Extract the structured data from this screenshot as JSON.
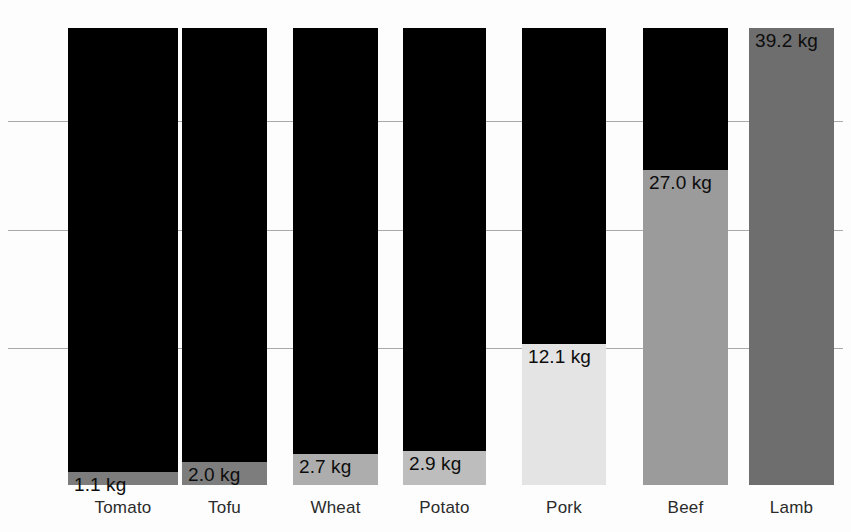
{
  "chart": {
    "type": "stacked-bar",
    "title": "",
    "units": "kg",
    "background_color": "#fdfdfd",
    "remainder_color": "#000000",
    "gridline_color": "#9a9a9a"
  },
  "chart_data": {
    "type": "bar",
    "title": "",
    "subtitle": "",
    "xlabel": "",
    "ylabel": "",
    "categories": [
      "Tomato",
      "Tofu",
      "Wheat",
      "Potato",
      "Pork",
      "Beef",
      "Lamb"
    ],
    "values": [
      1.1,
      2.0,
      2.7,
      2.9,
      12.1,
      27.0,
      39.2
    ],
    "value_labels": [
      "1.1 kg",
      "2.0 kg",
      "2.7 kg",
      "2.9 kg",
      "12.1 kg",
      "27.0 kg",
      "39.2 kg"
    ],
    "unit": "kg",
    "ylim": [
      0,
      39.2
    ],
    "grid": true,
    "gridlines": [
      11.7,
      21.9,
      31.2
    ],
    "legend": "none",
    "series": [
      {
        "name": "Value",
        "values": [
          1.1,
          2.0,
          2.7,
          2.9,
          12.1,
          27.0,
          39.2
        ]
      }
    ],
    "bar_fill_colors": [
      "#7c7c7c",
      "#7d7d7d",
      "#adadad",
      "#bdbdbd",
      "#e4e4e4",
      "#9b9b9b",
      "#6e6e6e"
    ]
  },
  "bars": [
    {
      "category": "Tomato",
      "value": 1.1,
      "value_label": "1.1 kg",
      "fill_color": "#7c7c7c",
      "label_on_fill": true,
      "left_px": 68,
      "width_px": 110
    },
    {
      "category": "Tofu",
      "value": 2.0,
      "value_label": "2.0 kg",
      "fill_color": "#7d7d7d",
      "label_on_fill": true,
      "left_px": 182,
      "width_px": 85
    },
    {
      "category": "Wheat",
      "value": 2.7,
      "value_label": "2.7 kg",
      "fill_color": "#adadad",
      "label_on_fill": true,
      "left_px": 293,
      "width_px": 85
    },
    {
      "category": "Potato",
      "value": 2.9,
      "value_label": "2.9 kg",
      "fill_color": "#bdbdbd",
      "label_on_fill": true,
      "left_px": 403,
      "width_px": 83
    },
    {
      "category": "Pork",
      "value": 12.1,
      "value_label": "12.1 kg",
      "fill_color": "#e4e4e4",
      "label_on_fill": true,
      "left_px": 522,
      "width_px": 84
    },
    {
      "category": "Beef",
      "value": 27.0,
      "value_label": "27.0 kg",
      "fill_color": "#9b9b9b",
      "label_on_fill": true,
      "left_px": 643,
      "width_px": 85
    },
    {
      "category": "Lamb",
      "value": 39.2,
      "value_label": "39.2 kg",
      "fill_color": "#6e6e6e",
      "label_on_fill": true,
      "left_px": 749,
      "width_px": 85
    }
  ],
  "axis": {
    "baseline_y_px": 485,
    "bar_top_y_px": 28,
    "gridline_y_px": [
      121,
      230,
      348
    ]
  }
}
